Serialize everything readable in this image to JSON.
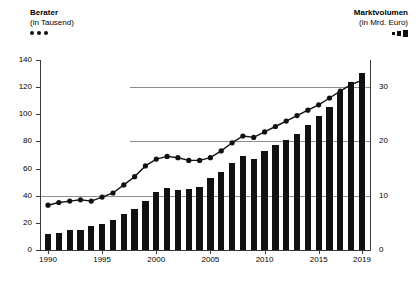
{
  "legend_left": {
    "title": "Berater",
    "subtitle": "(in Tausend)",
    "marker": "dot-series-marker"
  },
  "legend_right": {
    "title": "Marktvolumen",
    "subtitle": "(in Mrd. Euro)",
    "marker": "bar-series-marker"
  },
  "chart_data": {
    "type": "line",
    "title": "",
    "subtitle": "",
    "xlabel": "",
    "ylabel": "Berater (in Tausend)",
    "ylabel_right": "Marktvolumen (in Mrd. Euro)",
    "grid": true,
    "legend_position": "top",
    "xlim": [
      1990,
      2019
    ],
    "ylim": [
      0,
      140
    ],
    "ylim_right": [
      0,
      35
    ],
    "yticks": [
      0,
      20,
      40,
      60,
      80,
      100,
      120,
      140
    ],
    "yticks_right": [
      0,
      10,
      20,
      30
    ],
    "xticks": [
      1990,
      1995,
      2000,
      2005,
      2010,
      2015,
      2019
    ],
    "x": [
      1990,
      1991,
      1992,
      1993,
      1994,
      1995,
      1996,
      1997,
      1998,
      1999,
      2000,
      2001,
      2002,
      2003,
      2004,
      2005,
      2006,
      2007,
      2008,
      2009,
      2010,
      2011,
      2012,
      2013,
      2014,
      2015,
      2016,
      2017,
      2018,
      2019
    ],
    "series": [
      {
        "name": "Berater (in Tausend)",
        "type": "line",
        "axis": "left",
        "unit": "Tausend",
        "values": [
          33,
          35,
          36,
          37,
          36,
          39,
          42,
          48,
          54,
          62,
          67,
          69,
          68,
          66,
          66,
          68,
          73,
          79,
          84,
          83,
          87,
          91,
          95,
          99,
          103,
          107,
          112,
          117,
          122,
          125
        ]
      },
      {
        "name": "Marktvolumen (in Mrd. Euro)",
        "type": "bar",
        "axis": "right",
        "unit": "Mrd. Euro",
        "values": [
          3.0,
          3.2,
          3.6,
          3.6,
          4.4,
          4.8,
          5.6,
          6.6,
          7.6,
          9.0,
          10.6,
          11.4,
          11.0,
          11.2,
          11.6,
          13.2,
          14.4,
          16.0,
          17.4,
          16.8,
          18.2,
          19.4,
          20.2,
          21.4,
          23.0,
          24.6,
          26.4,
          29.2,
          31.0,
          32.6
        ]
      }
    ]
  }
}
